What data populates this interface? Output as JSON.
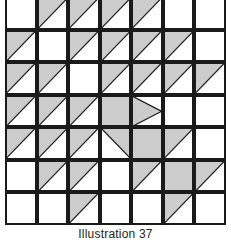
{
  "figure": {
    "caption": "Illustration 37",
    "type": "triangle-tiling-grid",
    "rows": 7,
    "columns": 7,
    "fill_color": "#cccccc",
    "stroke_color": "#1a1a1a",
    "background_color": "#ffffff",
    "cell_shapes": [
      [
        "empty",
        "upper-left",
        "upper-left",
        "upper-left",
        "upper-left",
        "empty",
        "empty"
      ],
      [
        "upper-left",
        "empty",
        "upper-left",
        "upper-left",
        "upper-left",
        "upper-left",
        "empty"
      ],
      [
        "upper-left",
        "upper-left",
        "empty",
        "upper-left",
        "upper-left",
        "upper-left",
        "upper-left"
      ],
      [
        "upper-left",
        "upper-left",
        "upper-left",
        "full",
        "left-half",
        "empty",
        "empty"
      ],
      [
        "upper-left",
        "upper-left",
        "upper-left",
        "upper-right",
        "full",
        "upper-left",
        "empty"
      ],
      [
        "empty",
        "upper-left",
        "upper-left",
        "empty",
        "upper-left",
        "full",
        "upper-left"
      ],
      [
        "empty",
        "empty",
        "upper-left",
        "empty",
        "empty",
        "upper-left",
        "empty"
      ]
    ],
    "shaded_cell_count": 34
  }
}
